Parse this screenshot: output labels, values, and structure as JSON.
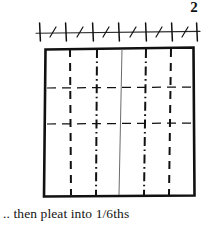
{
  "figure": {
    "step_number": "2",
    "caption": ".. then pleat into 1/6ths",
    "ink_color": "#111111",
    "paper_color": "#ffffff"
  },
  "diagram": {
    "ruler": {
      "label": "measuring-ruler",
      "baseline_y": 32,
      "x_start": 36,
      "x_end": 200,
      "major_tick_count": 7,
      "minor_tick_count": 6,
      "major_tick_positions": [
        40,
        66,
        93,
        119,
        146,
        172,
        197
      ],
      "minor_tick_positions": [
        53,
        80,
        106,
        133,
        159,
        185
      ],
      "major_tick_half_height": 9,
      "minor_tick_half_height": 5,
      "minor_tick_slant": 3
    },
    "sheet": {
      "label": "paper-square",
      "left": 45,
      "top": 48,
      "right": 194,
      "bottom": 196,
      "border_width": 2.6,
      "divisions": 6,
      "division_label": "1/6ths"
    },
    "fold_lines": {
      "vertical": [
        {
          "id": "fold-1",
          "x_top": 70,
          "x_bottom": 71,
          "style": "dashed",
          "fold": "valley"
        },
        {
          "id": "fold-2",
          "x_top": 97,
          "x_bottom": 96,
          "style": "dash-dot",
          "fold": "mountain"
        },
        {
          "id": "fold-3",
          "x_top": 122,
          "x_bottom": 119,
          "style": "solid-faint",
          "fold": "center"
        },
        {
          "id": "fold-4",
          "x_top": 146,
          "x_bottom": 144,
          "style": "dash-dot",
          "fold": "mountain"
        },
        {
          "id": "fold-5",
          "x_top": 171,
          "x_bottom": 169,
          "style": "dashed",
          "fold": "valley"
        }
      ],
      "horizontal": [
        {
          "id": "guide-1",
          "y": 88,
          "style": "dashed"
        },
        {
          "id": "guide-2",
          "y": 124,
          "style": "dashed"
        }
      ]
    }
  }
}
